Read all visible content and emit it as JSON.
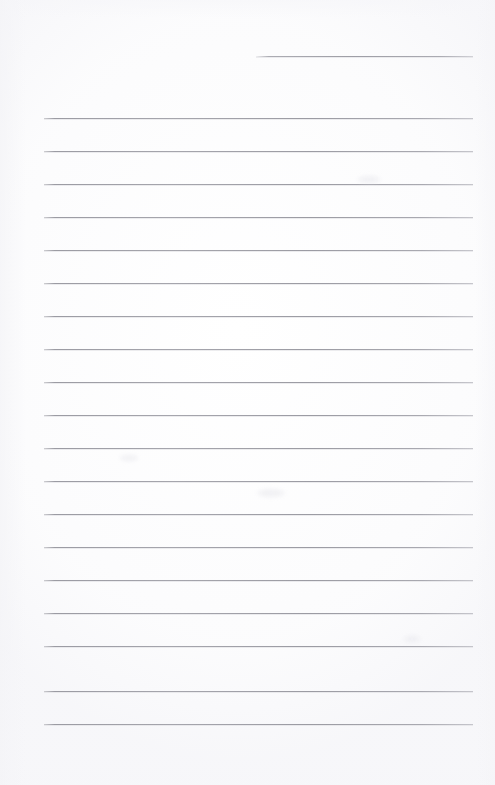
{
  "document": {
    "kind": "scanned-blank-lined-page",
    "title": "Blank lined notebook page",
    "page_width": 495,
    "page_height": 785,
    "background_color": "#ffffff",
    "rule_color": "#9a9aa2",
    "text_content": "",
    "written_text_present": "no"
  },
  "rules": {
    "count": 20,
    "full_width_count": 19,
    "partial_count": 1,
    "left_margin_x": 44,
    "right_edge_x": 473,
    "line_spacing_px": 33,
    "thickness_px": 1,
    "items": [
      {
        "name": "rule-partial-top",
        "x": 256,
        "y": 56,
        "width": 217,
        "partial": true
      },
      {
        "name": "rule-1",
        "x": 44,
        "y": 118,
        "width": 429,
        "partial": false
      },
      {
        "name": "rule-2",
        "x": 44,
        "y": 151,
        "width": 429,
        "partial": false
      },
      {
        "name": "rule-3",
        "x": 44,
        "y": 184,
        "width": 429,
        "partial": false
      },
      {
        "name": "rule-4",
        "x": 44,
        "y": 217,
        "width": 429,
        "partial": false
      },
      {
        "name": "rule-5",
        "x": 44,
        "y": 250,
        "width": 429,
        "partial": false
      },
      {
        "name": "rule-6",
        "x": 44,
        "y": 283,
        "width": 429,
        "partial": false
      },
      {
        "name": "rule-7",
        "x": 44,
        "y": 316,
        "width": 429,
        "partial": false
      },
      {
        "name": "rule-8",
        "x": 44,
        "y": 349,
        "width": 429,
        "partial": false
      },
      {
        "name": "rule-9",
        "x": 44,
        "y": 382,
        "width": 429,
        "partial": false
      },
      {
        "name": "rule-10",
        "x": 44,
        "y": 415,
        "width": 429,
        "partial": false
      },
      {
        "name": "rule-11",
        "x": 44,
        "y": 448,
        "width": 429,
        "partial": false
      },
      {
        "name": "rule-12",
        "x": 44,
        "y": 481,
        "width": 429,
        "partial": false
      },
      {
        "name": "rule-13",
        "x": 44,
        "y": 514,
        "width": 429,
        "partial": false
      },
      {
        "name": "rule-14",
        "x": 44,
        "y": 547,
        "width": 429,
        "partial": false
      },
      {
        "name": "rule-15",
        "x": 44,
        "y": 580,
        "width": 429,
        "partial": false
      },
      {
        "name": "rule-16",
        "x": 44,
        "y": 613,
        "width": 429,
        "partial": false
      },
      {
        "name": "rule-17",
        "x": 44,
        "y": 646,
        "width": 429,
        "partial": false
      },
      {
        "name": "rule-18",
        "x": 44,
        "y": 691,
        "width": 429,
        "partial": false
      },
      {
        "name": "rule-19",
        "x": 44,
        "y": 724,
        "width": 429,
        "partial": false
      }
    ]
  },
  "artifacts": {
    "smudges": [
      {
        "name": "scan-smudge-1",
        "x": 358,
        "y": 176,
        "width": 22,
        "height": 7
      },
      {
        "name": "scan-smudge-2",
        "x": 258,
        "y": 489,
        "width": 26,
        "height": 8
      },
      {
        "name": "scan-smudge-3",
        "x": 120,
        "y": 455,
        "width": 18,
        "height": 6
      },
      {
        "name": "scan-smudge-4",
        "x": 404,
        "y": 636,
        "width": 16,
        "height": 6
      }
    ]
  }
}
